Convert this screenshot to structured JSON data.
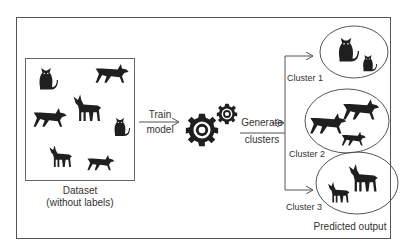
{
  "diagram": {
    "type": "unsupervised-learning-clustering",
    "dataset": {
      "title": "Dataset",
      "subtitle": "(without labels)",
      "items": [
        "cat",
        "dog",
        "goat",
        "dog",
        "cat",
        "goat",
        "dog"
      ]
    },
    "arrow_train": {
      "line1": "Train",
      "line2": "model"
    },
    "model_icon": "gears-icon",
    "arrow_generate": {
      "line1": "Generate",
      "line2": "clusters"
    },
    "clusters": [
      {
        "label": "Cluster 1",
        "items": [
          "cat",
          "cat"
        ]
      },
      {
        "label": "Cluster 2",
        "items": [
          "dog",
          "dog",
          "dog"
        ]
      },
      {
        "label": "Cluster 3",
        "items": [
          "goat",
          "goat"
        ]
      }
    ],
    "output_label": "Predicted output",
    "colors": {
      "silhouette": "#1f1f1f",
      "line": "#555555",
      "text": "#333333"
    }
  }
}
